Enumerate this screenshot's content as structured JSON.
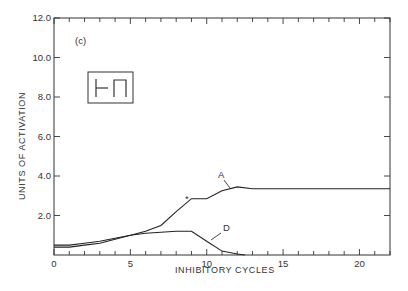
{
  "chart_data": {
    "type": "line",
    "title": "",
    "panel_label": "(c)",
    "xlabel": "INHIBITORY CYCLES",
    "ylabel": "UNITS OF ACTIVATION",
    "xlim": [
      0,
      22
    ],
    "ylim": [
      0,
      12
    ],
    "x_ticks": [
      0,
      5,
      10,
      15,
      20
    ],
    "x_tick_labels": [
      "0",
      "5",
      "10",
      "15",
      "20"
    ],
    "y_ticks": [
      2,
      4,
      6,
      8,
      10,
      12
    ],
    "y_tick_labels": [
      "2.0",
      "4.0",
      "6.0",
      "8.0",
      "10.0",
      "12.0"
    ],
    "grid": false,
    "legend": "none (curves labeled directly)",
    "inset_glyph": "⊢ Π",
    "annotations": [
      {
        "text": "A",
        "points_to": "series A near x=12"
      },
      {
        "text": "D",
        "points_to": "series D near x=10.5"
      },
      {
        "text": "*",
        "at": [
          8.8,
          2.9
        ]
      }
    ],
    "series": [
      {
        "name": "A",
        "x": [
          0,
          1,
          2,
          3,
          4,
          5,
          6,
          7,
          8,
          9,
          10,
          11,
          12,
          13,
          15,
          22
        ],
        "values": [
          0.5,
          0.5,
          0.6,
          0.7,
          0.85,
          1.0,
          1.2,
          1.5,
          2.2,
          2.85,
          2.85,
          3.25,
          3.45,
          3.35,
          3.35,
          3.35
        ]
      },
      {
        "name": "D",
        "x": [
          0,
          1,
          2,
          3,
          4,
          5,
          6,
          7,
          8,
          9,
          10,
          11,
          12,
          12.5
        ],
        "values": [
          0.4,
          0.4,
          0.5,
          0.6,
          0.8,
          1.0,
          1.1,
          1.15,
          1.2,
          1.2,
          0.7,
          0.2,
          0.05,
          0.0
        ]
      }
    ]
  }
}
